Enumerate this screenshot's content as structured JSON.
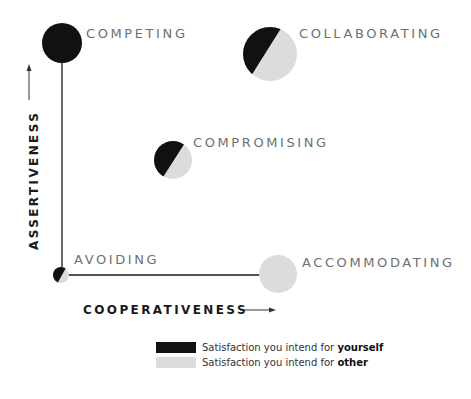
{
  "colors": {
    "self": "#111111",
    "other": "#dcdcdc",
    "label": "#6f6f6f",
    "axis": "#1a1a1a"
  },
  "axes": {
    "y_label": "ASSERTIVENESS",
    "x_label": "COOPERATIVENESS"
  },
  "modes": [
    {
      "id": "competing",
      "label": "COMPETING",
      "assertiveness": "high",
      "cooperativeness": "low",
      "self_share": 1.0,
      "other_share": 0.0
    },
    {
      "id": "collaborating",
      "label": "COLLABORATING",
      "assertiveness": "high",
      "cooperativeness": "high",
      "self_share": 0.5,
      "other_share": 0.5
    },
    {
      "id": "compromising",
      "label": "COMPROMISING",
      "assertiveness": "medium",
      "cooperativeness": "medium",
      "self_share": 0.5,
      "other_share": 0.5
    },
    {
      "id": "avoiding",
      "label": "AVOIDING",
      "assertiveness": "low",
      "cooperativeness": "low",
      "self_share": 0.5,
      "other_share": 0.5
    },
    {
      "id": "accommodating",
      "label": "ACCOMMODATING",
      "assertiveness": "low",
      "cooperativeness": "high",
      "self_share": 0.0,
      "other_share": 1.0
    }
  ],
  "legend": {
    "self": {
      "prefix": "Satisfaction you intend for ",
      "emphasis": "yourself"
    },
    "other": {
      "prefix": "Satisfaction you intend for ",
      "emphasis": "other"
    }
  }
}
